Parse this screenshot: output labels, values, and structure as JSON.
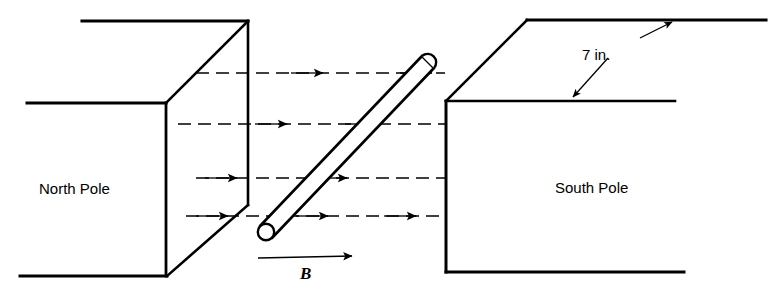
{
  "figure": {
    "type": "physics-diagram",
    "background_color": "#ffffff",
    "line_color": "#000000",
    "width": 769,
    "height": 297
  },
  "labels": {
    "north_pole": "North Pole",
    "south_pole": "South Pole",
    "dimension": "7 in.",
    "field_symbol": "B"
  },
  "elements": {
    "north_pole_block": {
      "name": "North Pole",
      "position": "left",
      "shape": "rectangular-block-isometric"
    },
    "south_pole_block": {
      "name": "South Pole",
      "position": "right",
      "shape": "rectangular-block-isometric"
    },
    "rod": {
      "name": "conductor-rod",
      "orientation": "diagonal",
      "end_caps": "rounded-circular"
    },
    "field_lines": {
      "name": "magnetic-field-lines",
      "count": 4,
      "style": "dashed-with-arrowheads",
      "direction": "left-to-right"
    },
    "field_vector": {
      "name": "B-vector-arrow",
      "direction": "left-to-right"
    },
    "dimension_marker": {
      "name": "depth-dimension",
      "value": "7 in.",
      "style": "double-headed-arrow"
    }
  }
}
